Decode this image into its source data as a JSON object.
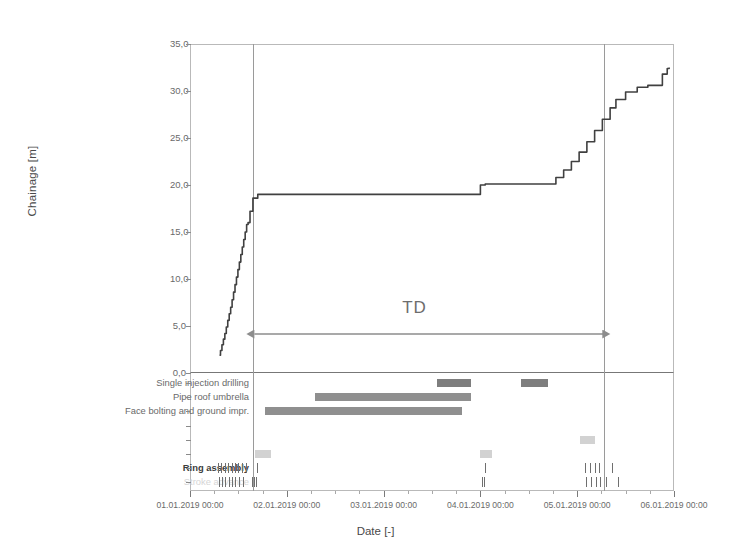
{
  "chart_data": {
    "type": "line",
    "title": "",
    "xlabel": "Date [-]",
    "ylabel": "Chainage [m]",
    "ylim": [
      0.0,
      35.0
    ],
    "ytick_labels": [
      "0,0",
      "5,0",
      "10,0",
      "15,0",
      "20,0",
      "25,0",
      "30,0",
      "35,0"
    ],
    "ytick_values": [
      0.0,
      5.0,
      10.0,
      15.0,
      20.0,
      25.0,
      30.0,
      35.0
    ],
    "xtick_labels": [
      "01.01.2019 00:00",
      "02.01.2019 00:00",
      "03.01.2019 00:00",
      "04.01.2019 00:00",
      "05.01.2019 00:00",
      "06.01.2019 00:00"
    ],
    "xlim_days": [
      0,
      5
    ],
    "grid": false,
    "legend": "none",
    "series": [
      {
        "name": "Chainage",
        "color": "#404040",
        "x_days": [
          0.305,
          0.315,
          0.33,
          0.345,
          0.36,
          0.375,
          0.39,
          0.405,
          0.42,
          0.435,
          0.45,
          0.465,
          0.48,
          0.495,
          0.51,
          0.525,
          0.54,
          0.555,
          0.57,
          0.585,
          0.6,
          0.62,
          0.65,
          0.7,
          2.95,
          3.0,
          3.05,
          3.7,
          3.78,
          3.86,
          3.94,
          4.02,
          4.1,
          4.18,
          4.26,
          4.34,
          4.4,
          4.5,
          4.62,
          4.73,
          4.8,
          4.88,
          4.93,
          4.95
        ],
        "y_values": [
          1.9,
          2.4,
          3.0,
          3.6,
          4.2,
          4.9,
          5.6,
          6.3,
          7.0,
          7.8,
          8.6,
          9.4,
          10.2,
          11.0,
          11.8,
          12.6,
          13.4,
          14.2,
          15.0,
          15.8,
          16.0,
          17.2,
          18.6,
          19.0,
          19.0,
          20.0,
          20.1,
          20.1,
          20.8,
          21.6,
          22.5,
          23.5,
          24.6,
          25.8,
          27.0,
          28.2,
          29.1,
          29.9,
          30.4,
          30.6,
          30.6,
          31.8,
          32.4,
          32.5
        ]
      }
    ],
    "annotations": [
      {
        "name": "TD",
        "label": "TD",
        "type": "double-arrow",
        "x_start_days": 0.655,
        "x_end_days": 4.28
      },
      {
        "name": "vertical-marker-1",
        "type": "vline",
        "x_days": 0.655
      },
      {
        "name": "vertical-marker-2",
        "type": "vline",
        "x_days": 4.28
      }
    ],
    "gantt": {
      "rows": [
        {
          "label": "Single injection drilling",
          "style": "normal",
          "bars": [
            {
              "start_days": 2.555,
              "end_days": 2.9,
              "shade": "dark"
            },
            {
              "start_days": 3.42,
              "end_days": 3.7,
              "shade": "dark"
            }
          ]
        },
        {
          "label": "Pipe roof umbrella",
          "style": "normal",
          "bars": [
            {
              "start_days": 1.295,
              "end_days": 2.9,
              "shade": "mid"
            }
          ]
        },
        {
          "label": "Face bolting and ground impr.",
          "style": "normal",
          "bars": [
            {
              "start_days": 0.775,
              "end_days": 2.815,
              "shade": "mid"
            }
          ]
        },
        {
          "label": "",
          "style": "faint",
          "bars": []
        },
        {
          "label": "",
          "style": "faint",
          "bars": [
            {
              "start_days": 4.03,
              "end_days": 4.18,
              "shade": "light"
            }
          ]
        },
        {
          "label": "",
          "style": "faint",
          "bars": [
            {
              "start_days": 0.67,
              "end_days": 0.84,
              "shade": "light"
            },
            {
              "start_days": 3.0,
              "end_days": 3.12,
              "shade": "light"
            }
          ]
        },
        {
          "label": "Ring assembly",
          "style": "bold",
          "ticks_days": [
            0.29,
            0.325,
            0.36,
            0.395,
            0.43,
            0.465,
            0.5,
            0.535,
            0.575,
            0.655,
            0.695,
            3.05,
            4.08,
            4.13,
            4.18,
            4.23,
            4.28,
            4.36
          ],
          "bars": []
        },
        {
          "label": "Stroke advance",
          "style": "faint",
          "ticks_days": [
            0.295,
            0.33,
            0.365,
            0.4,
            0.435,
            0.47,
            0.505,
            0.545,
            0.64,
            0.665,
            0.685,
            3.02,
            3.04,
            4.09,
            4.14,
            4.19,
            4.24,
            4.3,
            4.42
          ],
          "bars": []
        }
      ]
    }
  }
}
